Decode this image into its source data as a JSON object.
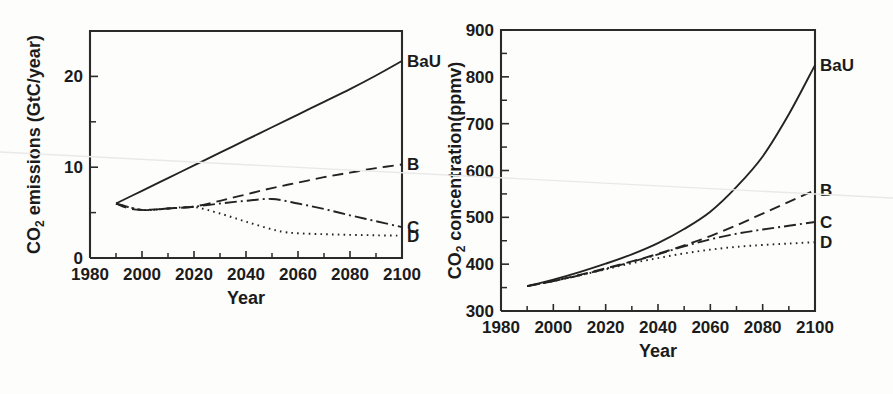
{
  "figure": {
    "background_color": "#fdfdfc",
    "ink_color": "#232323",
    "scan_artifact": "faint-diagonal-scan-line"
  },
  "panels": [
    {
      "id": "emissions",
      "title_icon": "co2-emissions-plot"
    },
    {
      "id": "concentration",
      "title_icon": "co2-concentration-plot"
    }
  ],
  "chart_data": [
    {
      "type": "line",
      "title": "",
      "xlabel": "Year",
      "ylabel": "CO2 emissions (GtC/year)",
      "ylabel_main": "CO",
      "ylabel_sub": "2",
      "ylabel_rest": " emissions (GtC/year)",
      "xlim": [
        1980,
        2100
      ],
      "ylim": [
        0,
        25
      ],
      "xticks": [
        1980,
        2000,
        2020,
        2040,
        2060,
        2080,
        2100
      ],
      "xticklabels": [
        "1980",
        "2000",
        "2020",
        "2040",
        "2060",
        "2080",
        "2100"
      ],
      "xtick_minor_step": 10,
      "yticks": [
        0,
        10,
        20
      ],
      "yticklabels": [
        "0",
        "10",
        "20"
      ],
      "ytick_minor": [
        5,
        15
      ],
      "grid": false,
      "legend_position": "right-edge-inline",
      "series": [
        {
          "name": "BaU",
          "label": "BaU",
          "style": "solid",
          "dasharray": "none",
          "label_y": 21.7,
          "x": [
            1990,
            2000,
            2010,
            2020,
            2030,
            2040,
            2050,
            2060,
            2070,
            2080,
            2090,
            2100
          ],
          "values": [
            6.0,
            7.4,
            8.8,
            10.2,
            11.6,
            13.0,
            14.4,
            15.8,
            17.2,
            18.6,
            20.1,
            21.7
          ]
        },
        {
          "name": "B",
          "label": "B",
          "style": "dashed",
          "dasharray": "11,6",
          "label_y": 10.3,
          "x": [
            1990,
            1995,
            2000,
            2005,
            2010,
            2015,
            2020,
            2030,
            2040,
            2050,
            2060,
            2070,
            2080,
            2090,
            2100
          ],
          "values": [
            6.0,
            5.45,
            5.3,
            5.35,
            5.45,
            5.55,
            5.65,
            6.3,
            7.0,
            7.7,
            8.3,
            8.9,
            9.4,
            9.9,
            10.3
          ]
        },
        {
          "name": "C",
          "label": "C",
          "style": "dash-dot",
          "dasharray": "12,4,2,4",
          "label_y": 3.4,
          "x": [
            1990,
            2000,
            2010,
            2020,
            2030,
            2040,
            2050,
            2060,
            2070,
            2080,
            2090,
            2100
          ],
          "values": [
            6.0,
            5.3,
            5.45,
            5.65,
            6.0,
            6.3,
            6.5,
            6.0,
            5.4,
            4.7,
            4.05,
            3.4
          ]
        },
        {
          "name": "D",
          "label": "D",
          "style": "dotted",
          "dasharray": "1.6,4.2",
          "label_y": 2.4,
          "x": [
            1990,
            2000,
            2010,
            2020,
            2030,
            2040,
            2050,
            2055,
            2060,
            2070,
            2080,
            2090,
            2100
          ],
          "values": [
            6.0,
            5.3,
            5.45,
            5.6,
            4.9,
            4.0,
            3.15,
            2.85,
            2.72,
            2.62,
            2.55,
            2.5,
            2.45
          ]
        }
      ]
    },
    {
      "type": "line",
      "title": "",
      "xlabel": "Year",
      "ylabel": "CO2 concentration(ppmv)",
      "ylabel_main": "CO",
      "ylabel_sub": "2",
      "ylabel_rest": " concentration(ppmv)",
      "xlim": [
        1980,
        2100
      ],
      "ylim": [
        300,
        900
      ],
      "xticks": [
        1980,
        2000,
        2020,
        2040,
        2060,
        2080,
        2100
      ],
      "xticklabels": [
        "1980",
        "2000",
        "2020",
        "2040",
        "2060",
        "2080",
        "2100"
      ],
      "xtick_minor_step": 10,
      "yticks": [
        300,
        400,
        500,
        600,
        700,
        800,
        900
      ],
      "yticklabels": [
        "300",
        "400",
        "500",
        "600",
        "700",
        "800",
        "900"
      ],
      "ytick_minor": [
        350,
        450,
        550,
        650,
        750,
        850
      ],
      "grid": false,
      "legend_position": "right-edge-inline",
      "series": [
        {
          "name": "BaU",
          "label": "BaU",
          "style": "solid",
          "dasharray": "none",
          "label_y": 825,
          "x": [
            1990,
            2000,
            2010,
            2020,
            2030,
            2040,
            2050,
            2060,
            2070,
            2080,
            2090,
            2100
          ],
          "values": [
            353,
            367,
            383,
            401,
            421,
            445,
            475,
            512,
            565,
            630,
            720,
            825
          ]
        },
        {
          "name": "B",
          "label": "B",
          "style": "dashed",
          "dasharray": "11,6",
          "label_y": 558,
          "x": [
            1990,
            2000,
            2010,
            2020,
            2030,
            2040,
            2050,
            2060,
            2070,
            2080,
            2090,
            2100
          ],
          "values": [
            353,
            364,
            377,
            391,
            406,
            422,
            440,
            460,
            483,
            508,
            533,
            558
          ]
        },
        {
          "name": "C",
          "label": "C",
          "style": "dash-dot",
          "dasharray": "12,4,2,4",
          "label_y": 490,
          "x": [
            1990,
            2000,
            2010,
            2020,
            2030,
            2040,
            2050,
            2060,
            2070,
            2080,
            2090,
            2100
          ],
          "values": [
            353,
            364,
            376,
            390,
            405,
            421,
            438,
            453,
            465,
            474,
            482,
            490
          ]
        },
        {
          "name": "D",
          "label": "D",
          "style": "dotted",
          "dasharray": "1.6,4.2",
          "label_y": 447,
          "x": [
            1990,
            2000,
            2010,
            2020,
            2030,
            2040,
            2050,
            2060,
            2070,
            2080,
            2090,
            2100
          ],
          "values": [
            353,
            364,
            376,
            389,
            402,
            413,
            423,
            431,
            437,
            441,
            444,
            447
          ]
        }
      ]
    }
  ]
}
